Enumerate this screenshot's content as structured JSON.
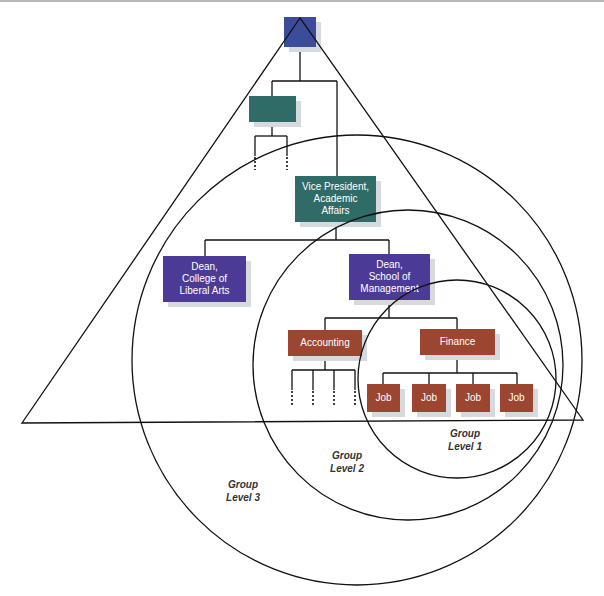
{
  "diagram": {
    "colors": {
      "top_box": "#3b4c9b",
      "vp_box": "#2f6c68",
      "dean_box": "#4c3b96",
      "dept_box": "#9c4530",
      "line": "#111111",
      "shadow": "#d6d9de"
    },
    "nodes": {
      "top": {
        "label": ""
      },
      "unlabeled_vp": {
        "label": ""
      },
      "vp_academic": {
        "line1": "Vice President,",
        "line2": "Academic",
        "line3": "Affairs"
      },
      "dean_liberal_arts": {
        "line1": "Dean,",
        "line2": "College of",
        "line3": "Liberal Arts"
      },
      "dean_management": {
        "line1": "Dean,",
        "line2": "School of",
        "line3": "Management"
      },
      "accounting": {
        "label": "Accounting"
      },
      "finance": {
        "label": "Finance"
      },
      "jobs": [
        {
          "label": "Job"
        },
        {
          "label": "Job"
        },
        {
          "label": "Job"
        },
        {
          "label": "Job"
        }
      ]
    },
    "group_levels": [
      {
        "line1": "Group",
        "line2": "Level 1"
      },
      {
        "line1": "Group",
        "line2": "Level 2"
      },
      {
        "line1": "Group",
        "line2": "Level 3"
      }
    ]
  }
}
